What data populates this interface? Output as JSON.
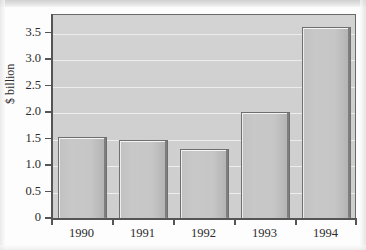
{
  "chart_data": {
    "type": "bar",
    "title": "",
    "subtitle": "",
    "xlabel": "",
    "ylabel": "$ billion",
    "categories": [
      "1990",
      "1991",
      "1992",
      "1993",
      "1994"
    ],
    "values": [
      1.52,
      1.47,
      1.3,
      2.0,
      3.6
    ],
    "series": [
      {
        "name": "$ billion",
        "values": [
          1.52,
          1.47,
          1.3,
          2.0,
          3.6
        ]
      }
    ],
    "ylim": [
      0,
      3.85
    ],
    "ytick_labels": [
      "0",
      "0.5",
      "1.0",
      "1.5",
      "2.0",
      "2.5",
      "3.0",
      "3.5"
    ],
    "ytick_values": [
      0,
      0.5,
      1.0,
      1.5,
      2.0,
      2.5,
      3.0,
      3.5
    ],
    "grid": true,
    "legend": false,
    "legend_position": "none",
    "annotations": []
  },
  "style": {
    "plot_background": "#d0d0d0",
    "bar_fill": "#c6c6c6",
    "bar_highlight": "#f4f4f4",
    "bar_shadow": "#7e7e7e",
    "gridline_color": "#efefef",
    "axis_color": "#555555",
    "text_color": "#2b2b2b"
  }
}
